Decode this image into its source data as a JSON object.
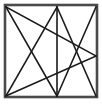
{
  "figure": {
    "type": "line-drawing",
    "canvas": {
      "width": 102,
      "height": 104
    },
    "background_color": "#ffffff",
    "frame": {
      "name": "square-border",
      "x": 5,
      "y": 5,
      "width": 92,
      "height": 92,
      "stroke_color": "#4a4a4a",
      "stroke_width": 2.6,
      "fill": "none"
    },
    "vertices": [
      {
        "label": "A",
        "role": "top-left-corner",
        "x": 6,
        "y": 7
      },
      {
        "label": "B",
        "role": "top-edge-point",
        "x": 57,
        "y": 7
      },
      {
        "label": "C",
        "role": "right-edge-point",
        "x": 96,
        "y": 56
      },
      {
        "label": "D",
        "role": "bottom-edge-point",
        "x": 57,
        "y": 96
      },
      {
        "label": "E",
        "role": "bottom-left-corner",
        "x": 6,
        "y": 96
      }
    ],
    "star": {
      "name": "pentagram",
      "step": 2,
      "stroke_color": "#1a1a1a",
      "stroke_width": 1.6,
      "fill": "none",
      "edges": [
        {
          "from": "A",
          "to": "C",
          "x1": 6,
          "y1": 7,
          "x2": 96,
          "y2": 56
        },
        {
          "from": "C",
          "to": "E",
          "x1": 96,
          "y1": 56,
          "x2": 6,
          "y2": 96
        },
        {
          "from": "E",
          "to": "B",
          "x1": 6,
          "y1": 96,
          "x2": 57,
          "y2": 7
        },
        {
          "from": "B",
          "to": "D",
          "x1": 57,
          "y1": 7,
          "x2": 57,
          "y2": 96
        },
        {
          "from": "D",
          "to": "A",
          "x1": 57,
          "y1": 96,
          "x2": 6,
          "y2": 7
        }
      ]
    },
    "extra_chords": [
      {
        "name": "top-right-to-bottom-center",
        "from": "top-right-corner",
        "to": "bottom-edge-point",
        "x1": 96,
        "y1": 7,
        "x2": 57,
        "y2": 96
      },
      {
        "name": "top-center-to-bottom-right",
        "from": "top-edge-point",
        "to": "bottom-right-corner",
        "x1": 57,
        "y1": 7,
        "x2": 96,
        "y2": 96
      }
    ]
  }
}
